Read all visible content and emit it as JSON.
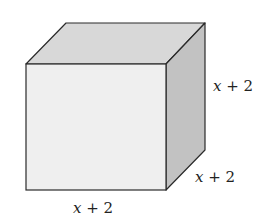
{
  "figure": {
    "shape": "cube",
    "colors": {
      "front": "#efefef",
      "top": "#d8d8d8",
      "side": "#c2c2c2",
      "edge": "#2a2a2a"
    },
    "labels": {
      "height": {
        "var": "x",
        "rest": " + 2"
      },
      "depth": {
        "var": "x",
        "rest": " + 2"
      },
      "width": {
        "var": "x",
        "rest": " + 2"
      }
    }
  }
}
